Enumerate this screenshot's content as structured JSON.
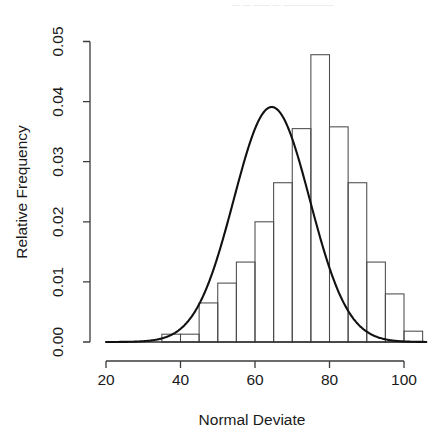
{
  "figure": {
    "background_color": "#ffffff",
    "foreground_color": "#1a1a1a",
    "top_artifact_text": "— — —— — ——————"
  },
  "chart_data": {
    "type": "bar",
    "title": "",
    "subtitle": "",
    "xlabel": "Normal Deviate",
    "ylabel": "Relative Frequency",
    "xlim": [
      20,
      100
    ],
    "ylim": [
      0,
      0.05
    ],
    "xticks": [
      20,
      40,
      60,
      80,
      100
    ],
    "xtick_labels": [
      "20",
      "40",
      "60",
      "80",
      "100"
    ],
    "yticks": [
      0.0,
      0.01,
      0.02,
      0.03,
      0.04,
      0.05
    ],
    "ytick_labels": [
      "0.00",
      "0.01",
      "0.02",
      "0.03",
      "0.04",
      "0.05"
    ],
    "grid": false,
    "legend": null,
    "bin_width": 5,
    "bin_edges": [
      35,
      40,
      45,
      50,
      55,
      60,
      65,
      70,
      75,
      80,
      85,
      90,
      95,
      100,
      105
    ],
    "categories": [
      "35-40",
      "40-45",
      "45-50",
      "50-55",
      "55-60",
      "60-65",
      "65-70",
      "70-75",
      "75-80",
      "80-85",
      "85-90",
      "90-95",
      "95-100",
      "100-105"
    ],
    "values": [
      0.0013,
      0.0013,
      0.0065,
      0.0098,
      0.0133,
      0.02,
      0.0265,
      0.0355,
      0.0478,
      0.0358,
      0.0265,
      0.0133,
      0.008,
      0.0018
    ],
    "series": [
      {
        "name": "Relative Frequency",
        "type": "bar",
        "values": [
          0.0013,
          0.0013,
          0.0065,
          0.0098,
          0.0133,
          0.02,
          0.0265,
          0.0355,
          0.0478,
          0.0358,
          0.0265,
          0.0133,
          0.008,
          0.0018
        ]
      },
      {
        "name": "Normal density overlay",
        "type": "line",
        "distribution": "normal",
        "mean": 64.5,
        "sd": 10.2,
        "peak_value": 0.0391,
        "peak_x": 64.5
      }
    ],
    "annotations": []
  }
}
